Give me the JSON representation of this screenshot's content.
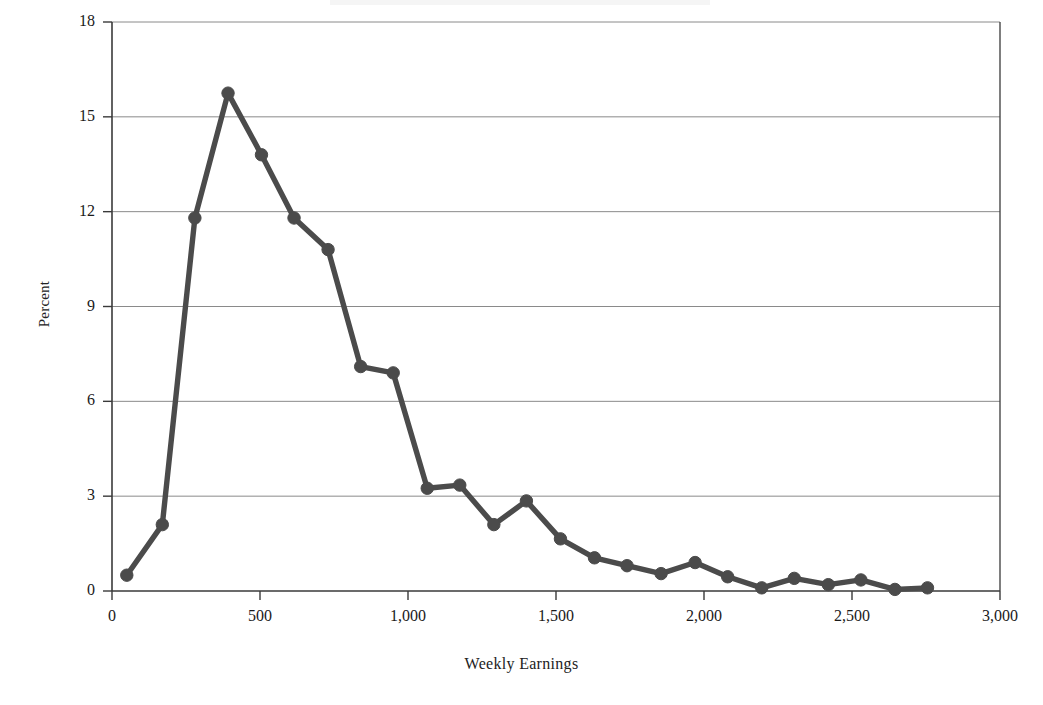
{
  "chart_data": {
    "type": "line",
    "title": "",
    "xlabel": "Weekly Earnings",
    "ylabel": "Percent",
    "xlim": [
      0,
      3000
    ],
    "ylim": [
      0,
      18
    ],
    "xticks": [
      0,
      500,
      1000,
      1500,
      2000,
      2500,
      3000
    ],
    "xtick_labels": [
      "0",
      "500",
      "1,000",
      "1,500",
      "2,000",
      "2,500",
      "3,000"
    ],
    "yticks": [
      0,
      3,
      6,
      9,
      12,
      15,
      18
    ],
    "ytick_labels": [
      "0",
      "3",
      "6",
      "9",
      "12",
      "15",
      "18"
    ],
    "grid": "horizontal",
    "legend": "none",
    "marker": "circle",
    "line_color": "#4b4b4b",
    "marker_color": "#4b4b4b",
    "axis_color": "#3a3a3a",
    "grid_color": "#8a8a8a",
    "x": [
      50,
      170,
      280,
      392,
      505,
      615,
      730,
      840,
      950,
      1065,
      1175,
      1290,
      1400,
      1515,
      1630,
      1740,
      1855,
      1970,
      2080,
      2195,
      2305,
      2420,
      2530,
      2645,
      2755
    ],
    "values": [
      0.5,
      2.1,
      11.8,
      15.75,
      13.8,
      11.8,
      10.8,
      7.1,
      6.9,
      3.25,
      3.35,
      2.1,
      2.85,
      1.65,
      1.05,
      0.8,
      0.55,
      0.9,
      0.45,
      0.1,
      0.4,
      0.2,
      0.35,
      0.05,
      0.1
    ],
    "series_name": "Percent of workers"
  },
  "axis": {
    "y_title": "Percent",
    "x_title": "Weekly Earnings"
  }
}
